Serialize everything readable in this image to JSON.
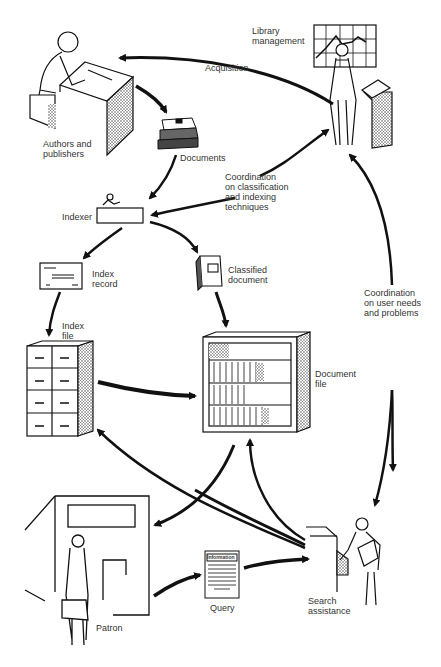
{
  "diagram": {
    "type": "library information system flow",
    "colors": {
      "ink": "#111111",
      "label": "#333333",
      "background": "#ffffff",
      "stipple": "#888888"
    },
    "nodes": [
      {
        "id": "authors",
        "label": "Authors and\npublishers"
      },
      {
        "id": "library_management",
        "label": "Library\nmanagement"
      },
      {
        "id": "documents",
        "label": "Documents"
      },
      {
        "id": "indexer",
        "label": "Indexer"
      },
      {
        "id": "index_record",
        "label": "Index\nrecord"
      },
      {
        "id": "classified_document",
        "label": "Classified\ndocument"
      },
      {
        "id": "index_file",
        "label": "Index\nfile"
      },
      {
        "id": "document_file",
        "label": "Document\nfile"
      },
      {
        "id": "patron",
        "label": "Patron"
      },
      {
        "id": "query",
        "label": "Query"
      },
      {
        "id": "search_assistance",
        "label": "Search\nassistance"
      }
    ],
    "edge_labels": {
      "acquisition": "Acquisition",
      "coord_classification": "Coordination\non classification\nand indexing\ntechniques",
      "coord_user_needs": "Coordination\non user needs\nand problems"
    },
    "query_doc_heading": "Information",
    "edges": [
      {
        "from": "library_management",
        "to": "authors",
        "label": "Acquisition"
      },
      {
        "from": "authors",
        "to": "documents"
      },
      {
        "from": "documents",
        "to": "indexer"
      },
      {
        "from": "library_management",
        "to": "indexer",
        "label": "Coordination on classification and indexing techniques",
        "bidirectional": true
      },
      {
        "from": "indexer",
        "to": "index_record"
      },
      {
        "from": "indexer",
        "to": "classified_document"
      },
      {
        "from": "index_record",
        "to": "index_file"
      },
      {
        "from": "classified_document",
        "to": "document_file"
      },
      {
        "from": "index_file",
        "to": "document_file"
      },
      {
        "from": "search_assistance",
        "to": "index_file"
      },
      {
        "from": "search_assistance",
        "to": "document_file"
      },
      {
        "from": "document_file",
        "to": "patron"
      },
      {
        "from": "patron",
        "to": "query"
      },
      {
        "from": "query",
        "to": "search_assistance"
      },
      {
        "from": "library_management",
        "to": "search_assistance",
        "label": "Coordination on user needs and problems",
        "bidirectional": true
      }
    ]
  }
}
